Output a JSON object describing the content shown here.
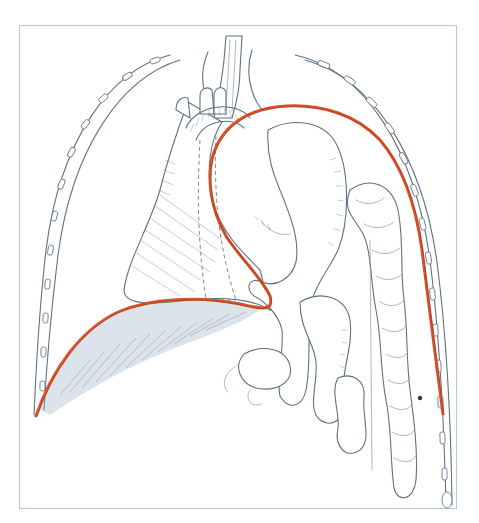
{
  "figure": {
    "type": "anatomical-illustration",
    "structures": [
      {
        "name": "trachea-esophagus",
        "label": ""
      },
      {
        "name": "heart",
        "label": ""
      },
      {
        "name": "stomach",
        "label": ""
      },
      {
        "name": "small-intestine",
        "label": ""
      },
      {
        "name": "colon",
        "label": ""
      },
      {
        "name": "rib-cage-left",
        "label": ""
      },
      {
        "name": "rib-cage-right",
        "label": ""
      },
      {
        "name": "diaphragm-line",
        "label": ""
      }
    ],
    "colors": {
      "diaphragm_line": "#d9502a",
      "ink": "#5f7183",
      "frame": "#b9c7dc",
      "background": "#ffffff"
    }
  }
}
